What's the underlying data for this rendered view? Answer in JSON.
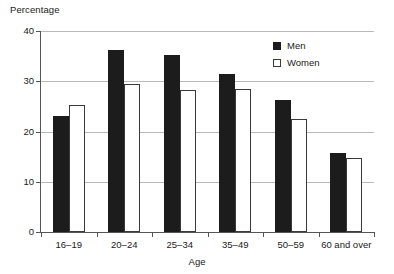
{
  "chart_data": {
    "type": "bar",
    "title": "",
    "subtitle": "",
    "xlabel": "Age",
    "ylabel": "Percentage",
    "ylim": [
      0,
      40
    ],
    "yticks": [
      0,
      10,
      20,
      30,
      40
    ],
    "ytick_labels": [
      "0",
      "10",
      "20",
      "30",
      "40"
    ],
    "grid": true,
    "grid_axis": "y",
    "legend_position": "top-right-inside",
    "categories": [
      "16–19",
      "20–24",
      "25–34",
      "35–49",
      "50–59",
      "60 and over"
    ],
    "series": [
      {
        "name": "Men",
        "color": "#1c1c1c",
        "fill": "solid-black",
        "values": [
          23.1,
          36.3,
          35.2,
          31.4,
          26.3,
          15.7
        ]
      },
      {
        "name": "Women",
        "color": "#ffffff",
        "fill": "white-outline",
        "values": [
          25.2,
          29.4,
          28.2,
          28.5,
          22.4,
          14.8
        ]
      }
    ],
    "annotations": []
  },
  "legend": {
    "entries": [
      {
        "label": "Men",
        "swatch": "filled-black-square"
      },
      {
        "label": "Women",
        "swatch": "white-outlined-square"
      }
    ]
  },
  "colors": {
    "men_fill": "#1c1c1c",
    "women_fill": "#ffffff",
    "women_stroke": "#3a3a3a",
    "gridline": "#b9b9b9",
    "axis": "#555555",
    "text": "#1a1a1a",
    "background": "#ffffff"
  }
}
